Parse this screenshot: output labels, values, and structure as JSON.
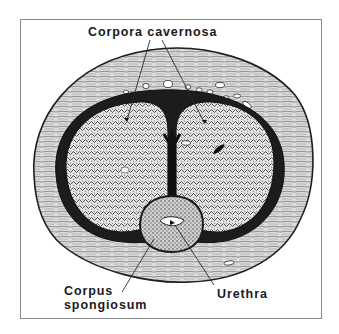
{
  "figure": {
    "type": "anatomical cross-section illustration",
    "labels": {
      "corpora_cavernosa": "Corpora cavernosa",
      "corpus_line1": "Corpus",
      "corpus_line2": "spongiosum",
      "urethra": "Urethra"
    },
    "colors": {
      "frame_border": "#8a8a8a",
      "ink": "#1a1a1a",
      "tissue_fill": "#d9d9d9",
      "erectile_fill": "#bdbdbd",
      "tunica": "#1e1e1e",
      "background": "#ffffff"
    }
  }
}
